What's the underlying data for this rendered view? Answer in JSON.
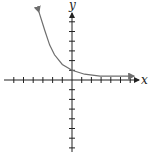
{
  "chart_data": {
    "type": "line",
    "title": "",
    "xlabel": "x",
    "ylabel": "y",
    "xlim": [
      -7,
      6
    ],
    "ylim": [
      -7,
      7
    ],
    "grid": false,
    "tick_spacing": 1,
    "tick_labels": false,
    "series": [
      {
        "name": "exponential decay curve",
        "x": [
          -3.4,
          -2.8,
          -2.3,
          -1.8,
          -1.0,
          0,
          1.3,
          2.9,
          6.4
        ],
        "y": [
          7.0,
          5.1,
          3.6,
          2.6,
          1.6,
          1.0,
          0.6,
          0.4,
          0.4
        ]
      }
    ],
    "annotations": [
      "y-intercept at (0, 1)",
      "horizontal asymptote approached as x increases"
    ]
  },
  "axes": {
    "x_label": "x",
    "y_label": "y"
  },
  "colors": {
    "axis": "#222222",
    "curve": "#6e6e6e"
  }
}
